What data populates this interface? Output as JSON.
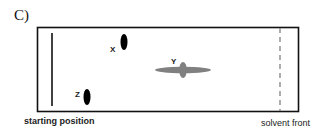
{
  "panel_label": "C)",
  "plate": {
    "starting_position_label": "starting position",
    "solvent_front_label": "solvent front"
  },
  "spots": [
    {
      "label": "X",
      "color": "#000000",
      "shape": "vertical-oval"
    },
    {
      "label": "Y",
      "color": "#808080",
      "shape": "streaked-horizontal"
    },
    {
      "label": "Z",
      "color": "#000000",
      "shape": "vertical-oval"
    }
  ],
  "colors": {
    "plate_border": "#111111",
    "start_line": "#111111",
    "solvent_front_line": "#8a8a8a",
    "dark_spot": "#000000",
    "gray_spot": "#808080"
  }
}
